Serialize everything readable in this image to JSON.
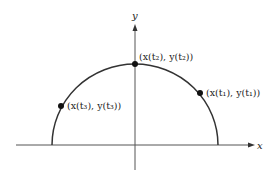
{
  "diagram": {
    "type": "parametric-curve-semicircle",
    "colors": {
      "stroke": "#333333",
      "point": "#111111",
      "axis": "#555555"
    },
    "axes": {
      "x_label": "x",
      "y_label": "y"
    },
    "curve": {
      "description": "upper semicircle traced by parametric curve (x(t), y(t))"
    },
    "points": [
      {
        "id": "t2",
        "label": "(x(t₂), y(t₂))",
        "x_expr": "x(t2)",
        "y_expr": "y(t2)"
      },
      {
        "id": "t1",
        "label": "(x(t₁), y(t₁))",
        "x_expr": "x(t1)",
        "y_expr": "y(t1)"
      },
      {
        "id": "t3",
        "label": "(x(t₃), y(t₃))",
        "x_expr": "x(t3)",
        "y_expr": "y(t3)"
      }
    ]
  }
}
